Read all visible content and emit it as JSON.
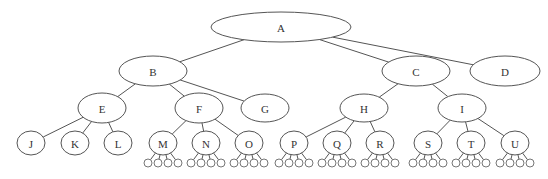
{
  "diagram": {
    "type": "tree",
    "colors": {
      "stroke": "#555555",
      "fill": "#ffffff",
      "text": "#333333"
    },
    "nodes": [
      {
        "id": "A",
        "label": "A",
        "cx": 281,
        "cy": 27,
        "rx": 70,
        "ry": 15,
        "parent": null
      },
      {
        "id": "B",
        "label": "B",
        "cx": 153,
        "cy": 71,
        "rx": 34,
        "ry": 15,
        "parent": "A"
      },
      {
        "id": "C",
        "label": "C",
        "cx": 416,
        "cy": 71,
        "rx": 34,
        "ry": 15,
        "parent": "A"
      },
      {
        "id": "D",
        "label": "D",
        "cx": 505,
        "cy": 71,
        "rx": 35,
        "ry": 15,
        "parent": "A"
      },
      {
        "id": "E",
        "label": "E",
        "cx": 102,
        "cy": 108,
        "rx": 24,
        "ry": 15,
        "parent": "B"
      },
      {
        "id": "F",
        "label": "F",
        "cx": 199,
        "cy": 108,
        "rx": 24,
        "ry": 15,
        "parent": "B"
      },
      {
        "id": "G",
        "label": "G",
        "cx": 265,
        "cy": 108,
        "rx": 24,
        "ry": 14,
        "parent": "B"
      },
      {
        "id": "H",
        "label": "H",
        "cx": 364,
        "cy": 108,
        "rx": 24,
        "ry": 14,
        "parent": "C"
      },
      {
        "id": "I",
        "label": "I",
        "cx": 462,
        "cy": 108,
        "rx": 24,
        "ry": 14,
        "parent": "C"
      },
      {
        "id": "J",
        "label": "J",
        "cx": 31,
        "cy": 143,
        "rx": 14,
        "ry": 12,
        "parent": "E"
      },
      {
        "id": "K",
        "label": "K",
        "cx": 75,
        "cy": 143,
        "rx": 14,
        "ry": 12,
        "parent": "E"
      },
      {
        "id": "L",
        "label": "L",
        "cx": 118,
        "cy": 143,
        "rx": 14,
        "ry": 12,
        "parent": "E"
      },
      {
        "id": "M",
        "label": "M",
        "cx": 163,
        "cy": 143,
        "rx": 14,
        "ry": 12,
        "parent": "F"
      },
      {
        "id": "N",
        "label": "N",
        "cx": 206,
        "cy": 143,
        "rx": 14,
        "ry": 12,
        "parent": "F"
      },
      {
        "id": "O",
        "label": "O",
        "cx": 249,
        "cy": 143,
        "rx": 14,
        "ry": 12,
        "parent": "F"
      },
      {
        "id": "P",
        "label": "P",
        "cx": 294,
        "cy": 143,
        "rx": 14,
        "ry": 12,
        "parent": "H"
      },
      {
        "id": "Q",
        "label": "Q",
        "cx": 337,
        "cy": 143,
        "rx": 14,
        "ry": 12,
        "parent": "H"
      },
      {
        "id": "R",
        "label": "R",
        "cx": 380,
        "cy": 143,
        "rx": 14,
        "ry": 12,
        "parent": "H"
      },
      {
        "id": "S",
        "label": "S",
        "cx": 428,
        "cy": 143,
        "rx": 14,
        "ry": 12,
        "parent": "I"
      },
      {
        "id": "T",
        "label": "T",
        "cx": 471,
        "cy": 143,
        "rx": 14,
        "ry": 12,
        "parent": "I"
      },
      {
        "id": "U",
        "label": "U",
        "cx": 515,
        "cy": 143,
        "rx": 14,
        "ry": 12,
        "parent": "I"
      }
    ],
    "unlabeled_leaf_groups": {
      "parents": [
        "M",
        "N",
        "O",
        "P",
        "Q",
        "R",
        "S",
        "T",
        "U"
      ],
      "count_per_parent": 4,
      "offsets_x": [
        -15,
        -5,
        5,
        15
      ],
      "cy": 163,
      "r": 4
    }
  }
}
